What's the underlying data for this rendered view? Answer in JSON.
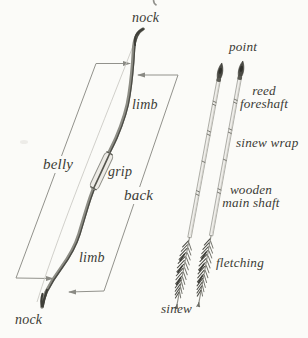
{
  "colors": {
    "background": "#fbfbf8",
    "ink": "#3b3b36",
    "measure_line": "#92928c",
    "stave_light": "#8d8d85",
    "stave_dark": "#4a4a44",
    "bowstring": "#cccbc5",
    "shaft_fill": "#efeeea",
    "shaft_outline": "#a2a29b",
    "feather_dark": "#4f4f49",
    "grip_fill": "#edebe6"
  },
  "bow": {
    "labels": {
      "nock_top": "nock",
      "limb_upper": "limb",
      "belly": "belly",
      "grip": "grip",
      "back": "back",
      "limb_lower": "limb",
      "nock_bottom": "nock"
    }
  },
  "arrows": {
    "labels": {
      "point": "point",
      "foreshaft_line1": "reed",
      "foreshaft_line2": "foreshaft",
      "sinew_wrap": "sinew wrap",
      "shaft_line1": "wooden",
      "shaft_line2": "main shaft",
      "fletching": "fletching",
      "sinew": "sinew"
    }
  }
}
